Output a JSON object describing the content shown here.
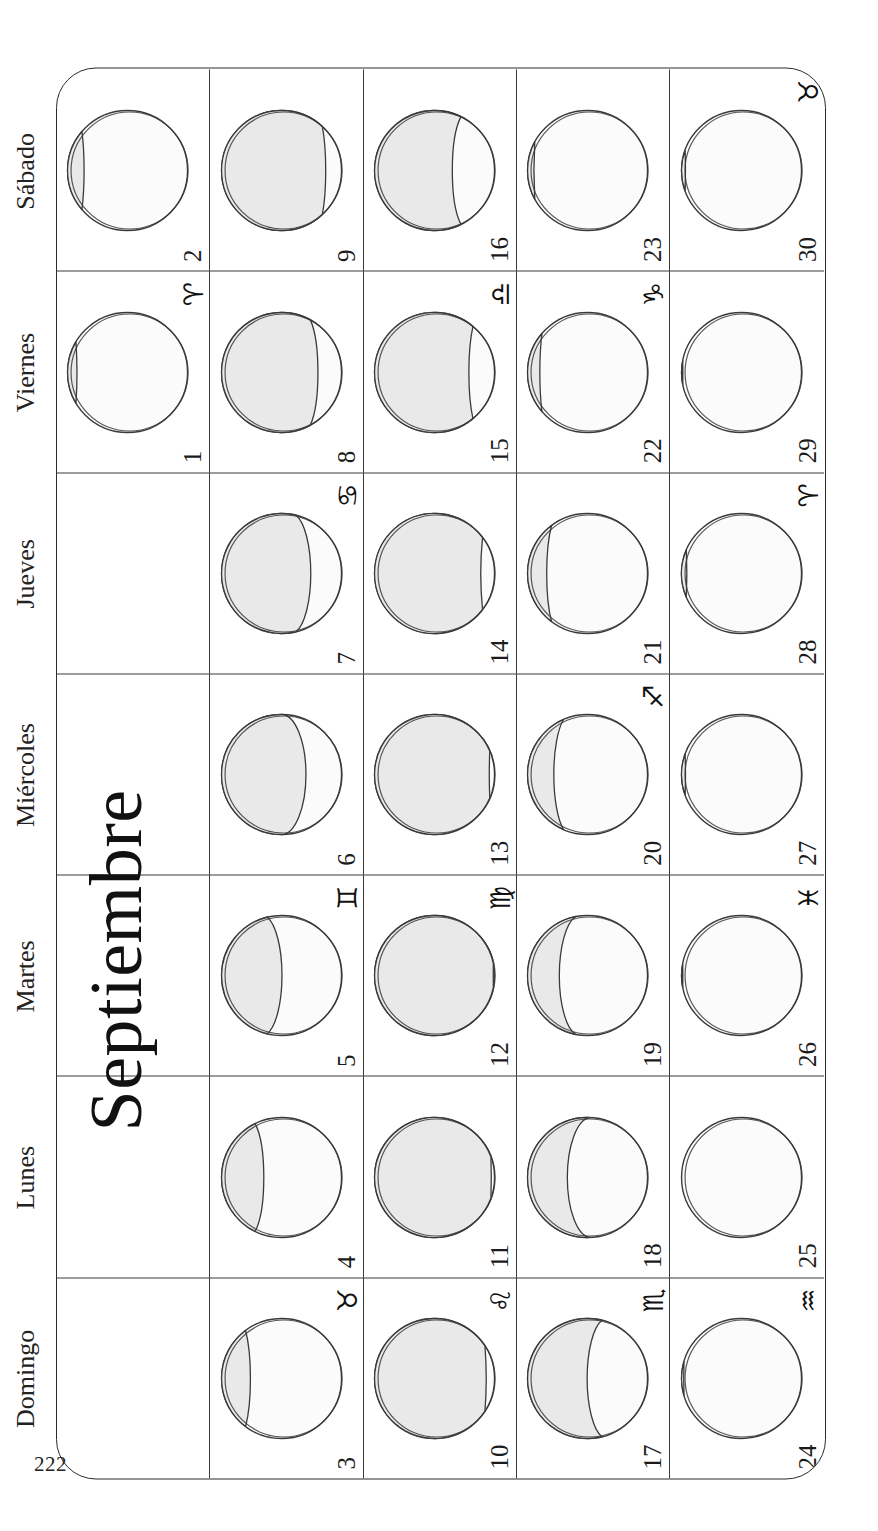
{
  "page": {
    "folio": "222",
    "month_title": "Septiembre",
    "language": "es"
  },
  "weekdays": [
    "Domingo",
    "Lunes",
    "Martes",
    "Miércoles",
    "Jueves",
    "Viernes",
    "Sábado"
  ],
  "colors": {
    "ink": "#1a1a1a",
    "rule": "#3a3a3a",
    "moon_shadow_fill": "#e9e9e9",
    "moon_lit_fill": "#fbfbfb",
    "paper": "#ffffff"
  },
  "zodiac_glyphs": {
    "aries": "♈",
    "taurus": "♉",
    "gemini": "♊",
    "cancer": "♋",
    "leo": "♌",
    "virgo": "♍",
    "libra": "♎",
    "scorpio": "♏",
    "sagittarius": "♐",
    "capricorn": "♑",
    "aquarius": "♒",
    "pisces": "♓"
  },
  "calendar": {
    "weeks": [
      {
        "days": [
          {
            "date": "",
            "zodiac": "",
            "empty": true
          },
          {
            "date": "",
            "zodiac": "",
            "empty": true
          },
          {
            "date": "",
            "zodiac": "",
            "empty": true
          },
          {
            "date": "",
            "zodiac": "",
            "empty": true
          },
          {
            "date": "",
            "zodiac": "",
            "empty": true
          },
          {
            "date": "1",
            "zodiac": "♈",
            "phase": "waning-crescent",
            "illum": 0.93,
            "waxing": false
          },
          {
            "date": "2",
            "zodiac": "",
            "phase": "waning-crescent",
            "illum": 0.88,
            "waxing": false
          }
        ]
      },
      {
        "days": [
          {
            "date": "3",
            "zodiac": "♉",
            "phase": "waning-crescent",
            "illum": 0.8,
            "waxing": false
          },
          {
            "date": "4",
            "zodiac": "",
            "phase": "waning-crescent",
            "illum": 0.72,
            "waxing": false
          },
          {
            "date": "5",
            "zodiac": "♊",
            "phase": "waning-gibbous",
            "illum": 0.62,
            "waxing": false
          },
          {
            "date": "6",
            "zodiac": "",
            "phase": "last-quarter",
            "illum": 0.5,
            "waxing": false
          },
          {
            "date": "7",
            "zodiac": "♋",
            "phase": "waning-crescent",
            "illum": 0.38,
            "waxing": false
          },
          {
            "date": "8",
            "zodiac": "",
            "phase": "waning-crescent",
            "illum": 0.26,
            "waxing": false
          },
          {
            "date": "9",
            "zodiac": "",
            "phase": "waning-crescent",
            "illum": 0.16,
            "waxing": false
          }
        ]
      },
      {
        "days": [
          {
            "date": "10",
            "zodiac": "♌",
            "phase": "waning-crescent",
            "illum": 0.08,
            "waxing": false
          },
          {
            "date": "11",
            "zodiac": "",
            "phase": "new-moon",
            "illum": 0.03,
            "waxing": false
          },
          {
            "date": "12",
            "zodiac": "♍",
            "phase": "new-moon",
            "illum": 0.01,
            "waxing": true
          },
          {
            "date": "13",
            "zodiac": "",
            "phase": "waxing-crescent",
            "illum": 0.04,
            "waxing": true
          },
          {
            "date": "14",
            "zodiac": "",
            "phase": "waxing-crescent",
            "illum": 0.1,
            "waxing": true
          },
          {
            "date": "15",
            "zodiac": "♎",
            "phase": "waxing-crescent",
            "illum": 0.18,
            "waxing": true
          },
          {
            "date": "16",
            "zodiac": "",
            "phase": "waxing-crescent",
            "illum": 0.28,
            "waxing": true
          }
        ]
      },
      {
        "days": [
          {
            "date": "17",
            "zodiac": "♏",
            "phase": "waxing-crescent",
            "illum": 0.38,
            "waxing": true
          },
          {
            "date": "18",
            "zodiac": "",
            "phase": "first-quarter",
            "illum": 0.48,
            "waxing": true
          },
          {
            "date": "19",
            "zodiac": "",
            "phase": "waxing-gibbous",
            "illum": 0.6,
            "waxing": true
          },
          {
            "date": "20",
            "zodiac": "♐",
            "phase": "waxing-gibbous",
            "illum": 0.7,
            "waxing": true
          },
          {
            "date": "21",
            "zodiac": "",
            "phase": "waxing-gibbous",
            "illum": 0.8,
            "waxing": true
          },
          {
            "date": "22",
            "zodiac": "♑",
            "phase": "waxing-gibbous",
            "illum": 0.88,
            "waxing": true
          },
          {
            "date": "23",
            "zodiac": "",
            "phase": "waxing-gibbous",
            "illum": 0.94,
            "waxing": true
          }
        ]
      },
      {
        "days": [
          {
            "date": "24",
            "zodiac": "♒",
            "phase": "full-moon",
            "illum": 0.98,
            "waxing": true
          },
          {
            "date": "25",
            "zodiac": "",
            "phase": "full-moon",
            "illum": 1.0,
            "waxing": false
          },
          {
            "date": "26",
            "zodiac": "♓",
            "phase": "waning-gibbous",
            "illum": 0.99,
            "waxing": false
          },
          {
            "date": "27",
            "zodiac": "",
            "phase": "waning-gibbous",
            "illum": 0.97,
            "waxing": false
          },
          {
            "date": "28",
            "zodiac": "♈",
            "phase": "waning-gibbous",
            "illum": 0.96,
            "waxing": false
          },
          {
            "date": "29",
            "zodiac": "",
            "phase": "waning-gibbous",
            "illum": 0.99,
            "waxing": false
          },
          {
            "date": "30",
            "zodiac": "♉",
            "phase": "waning-gibbous",
            "illum": 0.97,
            "waxing": false
          }
        ]
      }
    ]
  }
}
